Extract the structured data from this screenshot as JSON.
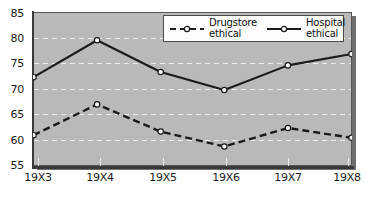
{
  "chart_data": {
    "type": "line",
    "title": "",
    "xlabel": "",
    "ylabel": "",
    "categories": [
      "19X3",
      "19X4",
      "19X5",
      "19X6",
      "19X7",
      "19X8"
    ],
    "ylim": [
      55,
      85
    ],
    "yticks": [
      55,
      60,
      65,
      70,
      75,
      80,
      85
    ],
    "grid": true,
    "legend_position": "top-center",
    "series": [
      {
        "name": "Drugstore\nethical",
        "name_line1": "Drugstore",
        "name_line2": "ethical",
        "style": "dashed",
        "marker": "open-circle",
        "color": "#1a1a1a",
        "values": [
          61.0,
          67.0,
          61.7,
          58.8,
          62.4,
          60.5
        ]
      },
      {
        "name": "Hospital\nethical",
        "name_line1": "Hospital",
        "name_line2": "ethical",
        "style": "solid",
        "marker": "open-circle",
        "color": "#1a1a1a",
        "values": [
          72.3,
          79.5,
          73.3,
          69.8,
          74.6,
          76.8
        ]
      }
    ]
  },
  "axis": {
    "y_labels": [
      "85",
      "80",
      "75",
      "70",
      "65",
      "60",
      "55"
    ],
    "x_labels": [
      "19X3",
      "19X4",
      "19X5",
      "19X6",
      "19X7",
      "19X8"
    ]
  },
  "legend": {
    "entries": [
      {
        "line1": "Drugstore",
        "line2": "ethical",
        "swatch": "dashed-open-circle-marker"
      },
      {
        "line1": "Hospital",
        "line2": "ethical",
        "swatch": "solid-open-circle-marker"
      }
    ]
  },
  "colors": {
    "plot_background": "#b9b9b9",
    "page_background": "#ffffff",
    "axis": "#3a3a3a",
    "gridline": "#f0f0f0",
    "series_line": "#1a1a1a",
    "shadow": "#6f6f6f",
    "legend_background": "#fdfdfd"
  }
}
